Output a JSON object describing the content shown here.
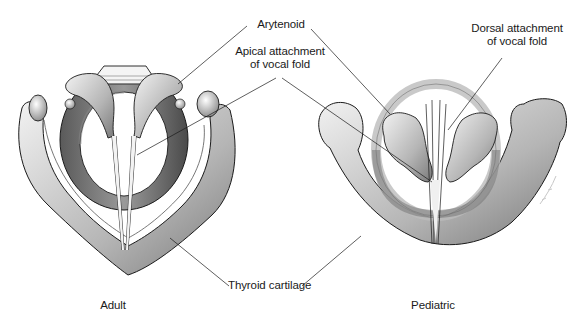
{
  "figure": {
    "panels": [
      {
        "id": "adult",
        "caption": "Adult"
      },
      {
        "id": "pediatric",
        "caption": "Pediatric"
      }
    ],
    "labels": {
      "arytenoid": "Arytenoid",
      "apical_line1": "Apical attachment",
      "apical_line2": "of vocal fold",
      "dorsal_line1": "Dorsal attachment",
      "dorsal_line2": "of vocal fold",
      "thyroid": "Thyroid cartilage"
    },
    "colors": {
      "ink": "#1a1a1a",
      "shade_dark": "#6e6e6e",
      "shade_mid": "#a8a8a8",
      "shade_light": "#d9d9d9",
      "paper": "#ffffff"
    }
  }
}
